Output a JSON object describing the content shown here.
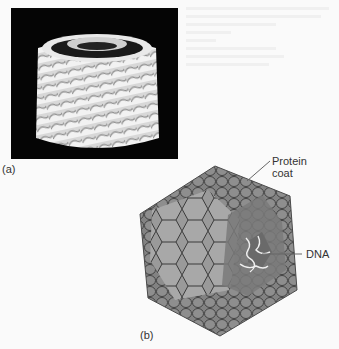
{
  "figure": {
    "panel_a": {
      "label": "(a)",
      "description": "Helical virus electron-model image: white cylindrical coil of protein subunits on black background"
    },
    "panel_b": {
      "label": "(b)",
      "description": "Icosahedral virus capsid drawn as hexagonal capsomeres with cut-away revealing DNA",
      "callouts": [
        {
          "text_line1": "Protein",
          "text_line2": "coat"
        },
        {
          "text_line1": "DNA"
        }
      ]
    }
  },
  "colors": {
    "background": "#fafafa",
    "panel_a_bg": "#050505",
    "capsomere_light": "#a4a4a4",
    "capsomere_mid": "#8c8c8c",
    "capsomere_dark": "#6e6e6e",
    "outline": "#3a3a3a",
    "label_text": "#333333"
  }
}
